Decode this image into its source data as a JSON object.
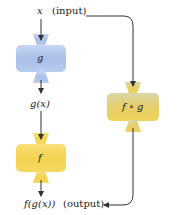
{
  "labels": {
    "input_var": "x",
    "input_tag": "(input)",
    "g_box": "g",
    "g_output": "g(x)",
    "f_box": "f",
    "composite_box": "f ∘ g",
    "final_output": "f(g(x))",
    "output_tag": "(output)"
  },
  "colors": {
    "g_box": "#a9bfe8",
    "f_box": "#f2d24e",
    "composite_box": "#e6cf6a",
    "arrow": "#333333"
  }
}
